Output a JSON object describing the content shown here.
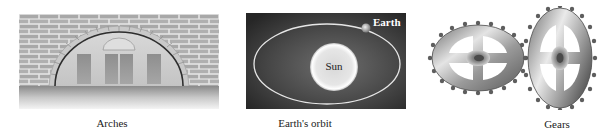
{
  "figures": [
    {
      "id": "arches",
      "caption": "Arches",
      "icon": "arch-icon"
    },
    {
      "id": "orbit",
      "caption": "Earth's orbit",
      "icon": "orbit-icon",
      "labels": {
        "sun": "Sun",
        "earth": "Earth"
      }
    },
    {
      "id": "gears",
      "caption": "Gears",
      "icon": "gears-icon"
    }
  ],
  "colors": {
    "brick": "#a9a9a9",
    "mortar": "#e6e6e6",
    "orbit_bg_dark": "#2a2a2a",
    "orbit_bg_light": "#6a6a6a",
    "orbit_line": "#e8e8e8",
    "sun_fill": "#f0f0f0",
    "gear_metal": "#9a9a9a"
  }
}
